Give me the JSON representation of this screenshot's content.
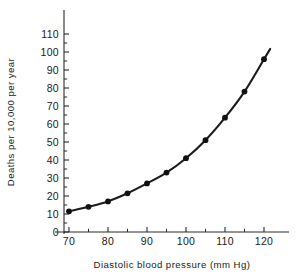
{
  "chart_data": {
    "type": "line",
    "title": "",
    "xlabel": "Diastolic  blood  pressure  (mm Hg)",
    "ylabel": "Deaths per 10,000 per year",
    "xlim": [
      65,
      125
    ],
    "ylim": [
      0,
      110
    ],
    "grid": false,
    "legend": null,
    "x": [
      70,
      75,
      80,
      85,
      90,
      95,
      100,
      105,
      110,
      115,
      120
    ],
    "values": [
      11.5,
      14,
      17,
      21.5,
      27,
      33,
      41,
      51,
      63.5,
      78,
      96
    ],
    "series": [
      {
        "name": "Deaths per 10,000 per year",
        "x": [
          70,
          75,
          80,
          85,
          90,
          95,
          100,
          105,
          110,
          115,
          120
        ],
        "values": [
          11.5,
          14,
          17,
          21.5,
          27,
          33,
          41,
          51,
          63.5,
          78,
          96
        ]
      }
    ],
    "x_ticks_major": [
      70,
      80,
      90,
      100,
      110,
      120
    ],
    "x_ticks_minor": [
      75,
      85,
      95,
      105,
      115
    ],
    "x_tick_labels": [
      "70",
      "80",
      "90",
      "100",
      "110",
      "120"
    ],
    "y_ticks_major": [
      0,
      10,
      20,
      30,
      40,
      50,
      60,
      70,
      80,
      90,
      100,
      110
    ],
    "y_ticks_minor": [
      5,
      15,
      25,
      35,
      45,
      55,
      65,
      75,
      85,
      95,
      105
    ],
    "y_tick_labels": [
      "0",
      "10",
      "20",
      "30",
      "40",
      "50",
      "60",
      "70",
      "80",
      "90",
      "100",
      "110"
    ],
    "marker": "filled-circle",
    "line_color": "#1c1c1c",
    "marker_color": "#111111",
    "axis_color": "#2b2b2b",
    "background_color": "#ffffff"
  }
}
